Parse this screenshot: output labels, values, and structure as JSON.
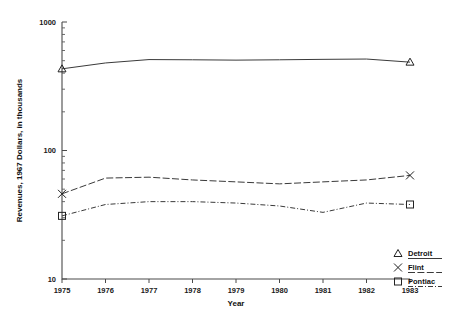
{
  "chart_data": {
    "type": "line",
    "title": "",
    "xlabel": "Year",
    "ylabel": "Revenues, 1967 Dollars, in thousands",
    "x": [
      1975,
      1976,
      1977,
      1978,
      1979,
      1980,
      1981,
      1982,
      1983
    ],
    "xtick_labels": [
      "1975",
      "1976",
      "1977",
      "1978",
      "1979",
      "1980",
      "1981",
      "1982",
      "1983"
    ],
    "xlim": [
      1975,
      1983
    ],
    "ylim": [
      10,
      1000
    ],
    "yscale": "log",
    "ytick_labels": [
      "1000",
      "100",
      "10"
    ],
    "ytick_values": [
      1000,
      100,
      10
    ],
    "grid": false,
    "legend_position": "lower right",
    "series": [
      {
        "name": "Detroit",
        "marker": "triangle",
        "linestyle": "solid",
        "values": [
          432,
          480,
          510,
          508,
          505,
          508,
          512,
          515,
          487
        ]
      },
      {
        "name": "Flint",
        "marker": "x",
        "linestyle": "dashed",
        "values": [
          46,
          61,
          62,
          59,
          57,
          55,
          57,
          59,
          64
        ]
      },
      {
        "name": "Pontiac",
        "marker": "square",
        "linestyle": "dash-dot",
        "values": [
          31,
          38,
          40,
          40,
          39,
          37,
          33,
          39,
          38
        ]
      }
    ]
  },
  "legend": {
    "items": [
      {
        "label": "Detroit",
        "marker": "triangle",
        "linestyle": "solid"
      },
      {
        "label": "Flint",
        "marker": "x",
        "linestyle": "dashed"
      },
      {
        "label": "Pontiac",
        "marker": "square",
        "linestyle": "dash-dot"
      }
    ]
  },
  "colors": {
    "line": "#3a3a3a",
    "axis": "#4a4a4a",
    "text": "#111111",
    "background": "#ffffff"
  }
}
